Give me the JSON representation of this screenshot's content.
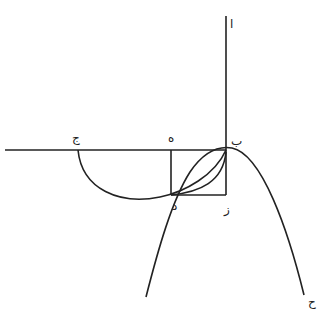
{
  "diagram": {
    "labels": {
      "alif": "ا",
      "ba": "ب",
      "jim": "ج",
      "ha": "ه",
      "dal": "د",
      "zay": "ز",
      "hha": "ح"
    },
    "points": {
      "alif": [
        226,
        17
      ],
      "ba": [
        226,
        150
      ],
      "jim": [
        78,
        150
      ],
      "ha": [
        171,
        150
      ],
      "dal": [
        171,
        195
      ],
      "zay": [
        226,
        195
      ],
      "hha": [
        304,
        298
      ]
    },
    "stroke_color": "#222222",
    "background": "#ffffff"
  }
}
